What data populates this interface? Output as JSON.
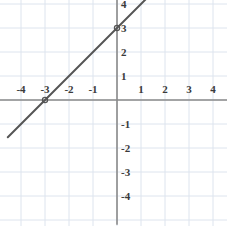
{
  "chart_data": {
    "type": "line",
    "title": "",
    "xlabel": "",
    "ylabel": "",
    "xlim": [
      -4.85,
      4.55
    ],
    "ylim": [
      -5.2,
      4.15
    ],
    "grid": true,
    "legend": "none",
    "grid_step": 1,
    "axes": {
      "x_axis_label_values": [
        "-4",
        "-3",
        "-2",
        "-1",
        "1",
        "2",
        "3",
        "4"
      ],
      "y_axis_label_values": [
        "4",
        "3",
        "2",
        "1",
        "-1",
        "-2",
        "-3",
        "-4"
      ]
    },
    "series": [
      {
        "name": "y = x + 3",
        "slope": 1,
        "y_intercept": 3,
        "x_intercept": -3,
        "points": [
          {
            "x": -3,
            "y": 0
          },
          {
            "x": 0,
            "y": 3
          }
        ],
        "draw_from": {
          "x": -4.55,
          "y": -1.55
        },
        "draw_to": {
          "x": 1.2,
          "y": 4.2
        },
        "color": "#555555"
      }
    ]
  },
  "ticks": {
    "x": [
      {
        "label": "-4",
        "value": -4
      },
      {
        "label": "-3",
        "value": -3
      },
      {
        "label": "-2",
        "value": -2
      },
      {
        "label": "-1",
        "value": -1
      },
      {
        "label": "1",
        "value": 1
      },
      {
        "label": "2",
        "value": 2
      },
      {
        "label": "3",
        "value": 3
      },
      {
        "label": "4",
        "value": 4
      }
    ],
    "y": [
      {
        "label": "4",
        "value": 4
      },
      {
        "label": "3",
        "value": 3
      },
      {
        "label": "2",
        "value": 2
      },
      {
        "label": "1",
        "value": 1
      },
      {
        "label": "-1",
        "value": -1
      },
      {
        "label": "-2",
        "value": -2
      },
      {
        "label": "-3",
        "value": -3
      },
      {
        "label": "-4",
        "value": -4
      }
    ]
  },
  "colors": {
    "grid": "#dde4ee",
    "axis": "#8a8a8a",
    "line": "#555555",
    "label": "#3a3a3a",
    "background": "#ffffff"
  },
  "geometry": {
    "origin_x": 117,
    "origin_y": 100,
    "unit_px": 24,
    "width": 227,
    "height": 226,
    "x_label_offset_y": 89,
    "y_label_offset_x": 121
  }
}
